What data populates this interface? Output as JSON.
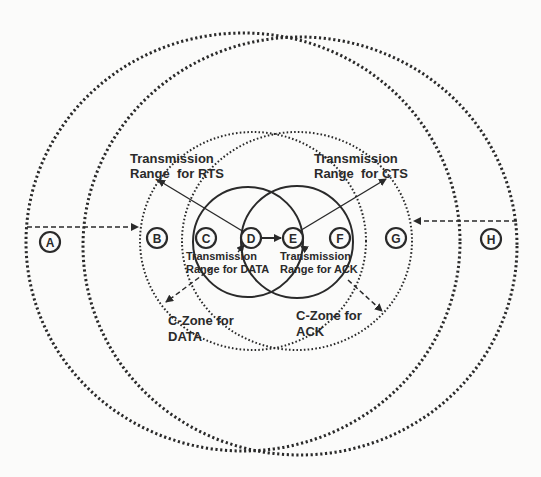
{
  "diagram": {
    "nodes": [
      {
        "id": "A",
        "label": "A",
        "x": 50,
        "y": 242
      },
      {
        "id": "B",
        "label": "B",
        "x": 157,
        "y": 238
      },
      {
        "id": "C",
        "label": "C",
        "x": 206,
        "y": 238
      },
      {
        "id": "D",
        "label": "D",
        "x": 251,
        "y": 238
      },
      {
        "id": "E",
        "label": "E",
        "x": 293,
        "y": 238
      },
      {
        "id": "F",
        "label": "F",
        "x": 340,
        "y": 238
      },
      {
        "id": "G",
        "label": "G",
        "x": 396,
        "y": 238
      },
      {
        "id": "H",
        "label": "H",
        "x": 491,
        "y": 239
      }
    ],
    "labels": {
      "rts_line1": "Transmission",
      "rts_line2": "Range  for RTS",
      "cts_line1": "Transmission",
      "cts_line2": "Range  for CTS",
      "data_line1": "Transmission",
      "data_line2": "Range for DATA",
      "ack_line1": "Transmission",
      "ack_line2": "Range for ACK",
      "czone_data_line1": "C-Zone for",
      "czone_data_line2": "DATA",
      "czone_ack_line1": "C-Zone for",
      "czone_ack_line2": "ACK"
    },
    "ranges": [
      {
        "name": "outer-range-left",
        "style": "dotted"
      },
      {
        "name": "outer-range-right",
        "style": "dotted"
      },
      {
        "name": "rts-range",
        "style": "dotted"
      },
      {
        "name": "cts-range",
        "style": "dotted"
      },
      {
        "name": "data-range",
        "style": "solid"
      },
      {
        "name": "ack-range",
        "style": "solid"
      }
    ],
    "colors": {
      "ink": "#2a2a2a",
      "background": "#fbfbfa"
    }
  }
}
